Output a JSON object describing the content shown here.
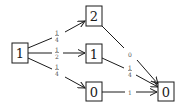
{
  "diagram": {
    "type": "probability-transition-graph",
    "nodes": [
      {
        "id": "start",
        "label": "1"
      },
      {
        "id": "top",
        "label": "2"
      },
      {
        "id": "mid",
        "label": "1"
      },
      {
        "id": "bot",
        "label": "0"
      },
      {
        "id": "end",
        "label": "0"
      }
    ],
    "edges": [
      {
        "from": "start",
        "to": "top",
        "label": {
          "num": "1",
          "den": "4"
        }
      },
      {
        "from": "start",
        "to": "mid",
        "label": {
          "num": "1",
          "den": "2"
        }
      },
      {
        "from": "start",
        "to": "bot",
        "label": {
          "num": "1",
          "den": "4"
        }
      },
      {
        "from": "top",
        "to": "end",
        "label": {
          "text": "0"
        }
      },
      {
        "from": "mid",
        "to": "end",
        "label": {
          "num": "1",
          "den": "4"
        }
      },
      {
        "from": "bot",
        "to": "end",
        "label": {
          "text": "1"
        }
      }
    ]
  }
}
